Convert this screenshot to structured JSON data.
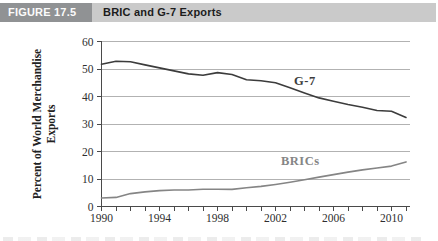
{
  "header": {
    "figure_label": "FIGURE 17.5",
    "title": "BRIC and G-7 Exports"
  },
  "colors": {
    "header_label_bg": "#909294",
    "header_title_bg": "#cacaca",
    "grid": "#b2b2b2",
    "axis": "#4a4a4a",
    "tick_label": "#2e2e2e",
    "axis_title": "#222222"
  },
  "chart_data": {
    "type": "line",
    "title": "",
    "xlabel": "",
    "ylabel_lines": [
      "Percent of World Merchandise",
      "Exports"
    ],
    "ylim": [
      0,
      60
    ],
    "yticks": [
      0,
      10,
      20,
      30,
      40,
      50,
      60
    ],
    "grid": true,
    "legend_position": "inline-labels",
    "x": [
      1990,
      1991,
      1992,
      1993,
      1994,
      1995,
      1996,
      1997,
      1998,
      1999,
      2000,
      2001,
      2002,
      2003,
      2004,
      2005,
      2006,
      2007,
      2008,
      2009,
      2010,
      2011
    ],
    "xticks_labeled": [
      1990,
      1994,
      1998,
      2002,
      2006,
      2010
    ],
    "series": [
      {
        "name": "G-7",
        "color": "#3c3c3c",
        "values": [
          51.7,
          52.8,
          52.6,
          51.5,
          50.4,
          49.3,
          48.2,
          47.7,
          48.7,
          48.0,
          46.1,
          45.7,
          45.0,
          43.2,
          41.3,
          39.5,
          38.3,
          37.1,
          36.1,
          34.9,
          34.6,
          32.4
        ],
        "label": {
          "text": "G-7",
          "x": 294,
          "y": 85
        }
      },
      {
        "name": "BRICs",
        "color": "#858585",
        "values": [
          3.1,
          3.3,
          4.7,
          5.3,
          5.8,
          6.0,
          6.0,
          6.3,
          6.3,
          6.2,
          6.8,
          7.3,
          8.0,
          8.8,
          9.7,
          10.7,
          11.6,
          12.5,
          13.3,
          14.0,
          14.7,
          16.2
        ],
        "label": {
          "text": "BRICs",
          "x": 281,
          "y": 165
        }
      }
    ]
  }
}
